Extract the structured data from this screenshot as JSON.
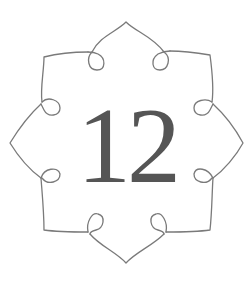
{
  "emblem": {
    "number": "12",
    "stroke_color": "#7a7a7a",
    "text_color": "#555555",
    "background": "#ffffff"
  }
}
